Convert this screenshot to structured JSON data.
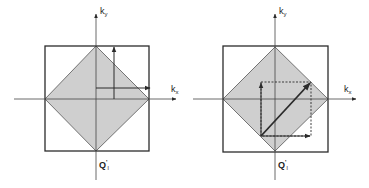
{
  "colors": {
    "stroke": "#2b2b2b",
    "fill": "#cfcfcf",
    "background": "#ffffff"
  },
  "panels": [
    {
      "id": "left",
      "axis_y_label": {
        "base": "k",
        "sub": "y"
      },
      "axis_x_label": {
        "base": "k",
        "sub": "x"
      },
      "bottom_label": {
        "base": "Q",
        "prime": "'",
        "sub": "l"
      },
      "square": {
        "x": 45,
        "y": 46,
        "w": 104,
        "h": 105
      },
      "diamond": [
        [
          96,
          46
        ],
        [
          149,
          99
        ],
        [
          96,
          151
        ],
        [
          45,
          99
        ]
      ],
      "axes": {
        "x": [
          14,
          176,
          99
        ],
        "y": [
          96,
          14,
          180
        ]
      },
      "arrows": [
        {
          "name": "vertical-arrow",
          "x1": 114,
          "y1": 99,
          "x2": 114,
          "y2": 47,
          "bold": false
        },
        {
          "name": "horizontal-arrow",
          "x1": 96,
          "y1": 88,
          "x2": 150,
          "y2": 88,
          "bold": false
        }
      ]
    },
    {
      "id": "right",
      "axis_y_label": {
        "base": "k",
        "sub": "y"
      },
      "axis_x_label": {
        "base": "k",
        "sub": "x"
      },
      "bottom_label": {
        "base": "Q",
        "prime": "'",
        "sub": "l"
      },
      "square": {
        "x": 223,
        "y": 46,
        "w": 105,
        "h": 106
      },
      "diamond": [
        [
          275,
          47
        ],
        [
          328,
          99
        ],
        [
          275,
          151
        ],
        [
          223,
          99
        ]
      ],
      "axes": {
        "x": [
          193,
          356,
          99
        ],
        "y": [
          275,
          14,
          180
        ]
      },
      "dashed_rect": {
        "x1": 261,
        "y1": 82,
        "x2": 311,
        "y2": 136
      },
      "arrows": [
        {
          "name": "vertical-arrow",
          "x1": 261,
          "y1": 136,
          "x2": 261,
          "y2": 83,
          "bold": false
        },
        {
          "name": "horizontal-arrow",
          "x1": 261,
          "y1": 136,
          "x2": 310,
          "y2": 136,
          "bold": false
        },
        {
          "name": "diagonal-arrow",
          "x1": 261,
          "y1": 136,
          "x2": 310,
          "y2": 83,
          "bold": true
        }
      ]
    }
  ]
}
